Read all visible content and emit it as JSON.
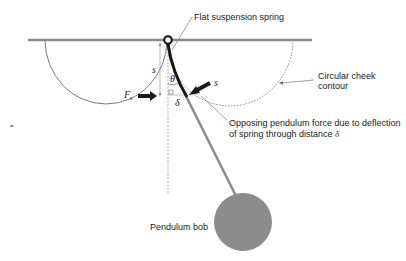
{
  "figure": {
    "type": "physics-diagram"
  },
  "labels": {
    "flat_spring": "Flat suspension spring",
    "cheek_contour_line1": "Circular cheek",
    "cheek_contour_line2": "contour",
    "opposing_force_line1": "Opposing pendulum force due to deflection",
    "opposing_force_line2_prefix": "of spring through distance ",
    "opposing_force_line2_symbol": "δ",
    "pendulum_bob": "Pendulum bob",
    "s_left": "s",
    "s_right": "s",
    "theta": "θ",
    "delta": "δ",
    "force_symbol": "F",
    "force_subscript": "s",
    "margin_mark": "="
  },
  "colors": {
    "beam": "#8a8a8a",
    "spring": "#1a1a1a",
    "rod": "#8a8a8a",
    "bob": "#8c8c8c",
    "contour": "#555555",
    "leader": "#777777",
    "arrow": "#1a1a1a"
  }
}
